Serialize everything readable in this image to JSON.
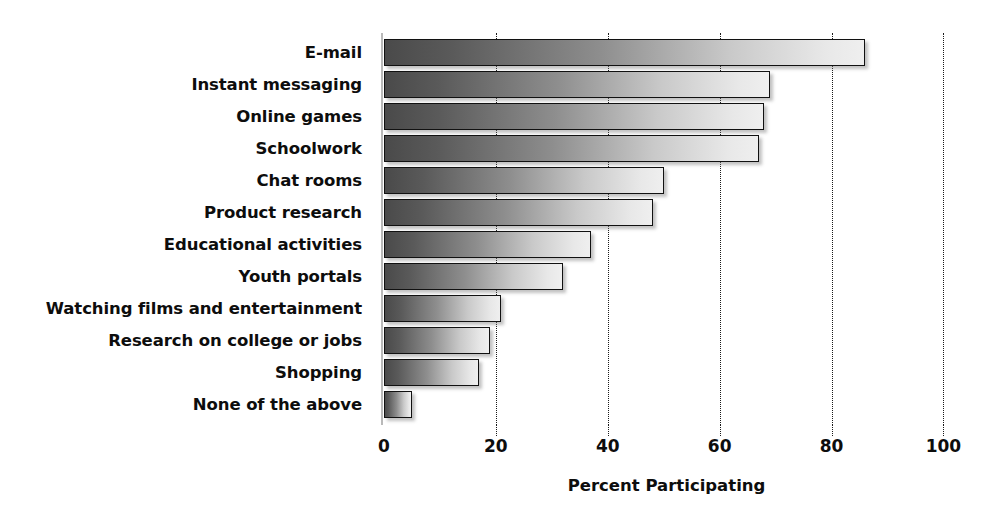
{
  "chart_data": {
    "type": "bar",
    "orientation": "horizontal",
    "title": "",
    "xlabel": "Percent Participating",
    "ylabel": "",
    "xlim": [
      0,
      101
    ],
    "xticks": [
      0,
      20,
      40,
      60,
      80,
      100
    ],
    "xticklabels": [
      "0",
      "20",
      "40",
      "60",
      "80",
      "100"
    ],
    "grid": "vertical-dotted",
    "legend": "none",
    "categories": [
      "E-mail",
      "Instant messaging",
      "Online games",
      "Schoolwork",
      "Chat rooms",
      "Product research",
      "Educational activities",
      "Youth portals",
      "Watching films and entertainment",
      "Research on college or jobs",
      "Shopping",
      "None of the above"
    ],
    "values": [
      86,
      69,
      68,
      67,
      50,
      48,
      37,
      32,
      21,
      19,
      17,
      5
    ],
    "bar_style": {
      "fill": "horizontal-gradient-dark-to-light",
      "gradient_start": "#4a4a4a",
      "gradient_end": "#efefef",
      "border": "#111111",
      "shadow": "#787878"
    }
  },
  "axis": {
    "x_title": "Percent Participating",
    "tick_labels": [
      "0",
      "20",
      "40",
      "60",
      "80",
      "100"
    ]
  }
}
